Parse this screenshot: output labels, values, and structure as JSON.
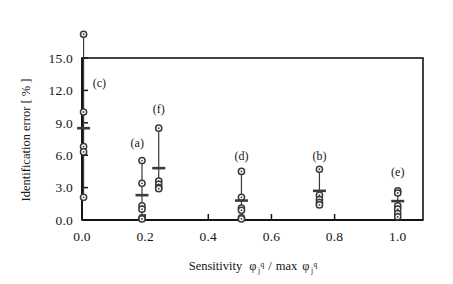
{
  "figure": {
    "name": "identification-error-vs-sensitivity-scatter"
  },
  "chart_data": {
    "type": "scatter",
    "title": "",
    "subtitle": "",
    "xlabel": "Sensitivity  φ j q / max φ j q",
    "xlabel_parts": {
      "word": "Sensitivity",
      "phi": "φ",
      "sub": "j",
      "sup": "q",
      "slash": "/",
      "max": "max"
    },
    "ylabel": "Identification error [ % ]",
    "ylabel_parts": {
      "text": "Identification error [",
      "unit": "%",
      "close": "]"
    },
    "xlim": [
      0.0,
      1.08
    ],
    "ylim": [
      0.0,
      15.0
    ],
    "xticks": [
      0.0,
      0.2,
      0.4,
      0.6,
      0.8,
      1.0
    ],
    "xtick_labels": [
      "0.0",
      "0.2",
      "0.4",
      "0.6",
      "0.8",
      "1.0"
    ],
    "yticks": [
      0.0,
      3.0,
      6.0,
      9.0,
      12.0,
      15.0
    ],
    "ytick_labels": [
      "0.0",
      "3.0",
      "6.0",
      "9.0",
      "12.0",
      "15.0"
    ],
    "grid": false,
    "legend": "none",
    "frame": "box",
    "marker": "open-circle",
    "mean_marker": "horizontal-dash",
    "range_bar": true,
    "axis_color": "#151515",
    "marker_color": "#3a3a3a",
    "series": [
      {
        "name": "(c)",
        "label": "(c)",
        "x": 0.005,
        "label_x": 0.055,
        "label_y": 12.3,
        "range_low": 2.1,
        "range_high": 17.2,
        "mean": 8.5,
        "values": [
          17.2,
          10.0,
          6.8,
          6.3,
          2.1
        ]
      },
      {
        "name": "(a)",
        "label": "(a)",
        "x": 0.19,
        "label_x": 0.175,
        "label_y": 6.8,
        "range_low": 0.1,
        "range_high": 5.5,
        "mean": 2.3,
        "values": [
          5.5,
          3.4,
          1.3,
          1.0,
          0.2,
          0.1
        ]
      },
      {
        "name": "(f)",
        "label": "(f)",
        "x": 0.243,
        "label_x": 0.243,
        "label_y": 9.9,
        "range_low": 2.8,
        "range_high": 8.5,
        "mean": 4.8,
        "values": [
          8.5,
          3.6,
          3.3,
          3.0,
          2.9
        ]
      },
      {
        "name": "(d)",
        "label": "(d)",
        "x": 0.505,
        "label_x": 0.505,
        "label_y": 5.6,
        "range_low": 0.1,
        "range_high": 4.5,
        "mean": 1.8,
        "values": [
          4.5,
          2.1,
          1.1,
          0.9,
          0.2,
          0.1
        ]
      },
      {
        "name": "(b)",
        "label": "(b)",
        "x": 0.752,
        "label_x": 0.752,
        "label_y": 5.6,
        "range_low": 1.4,
        "range_high": 4.7,
        "mean": 2.7,
        "values": [
          4.7,
          2.3,
          1.9,
          1.6,
          1.4
        ]
      },
      {
        "name": "(e)",
        "label": "(e)",
        "x": 1.0,
        "label_x": 1.0,
        "label_y": 4.1,
        "range_low": 0.3,
        "range_high": 2.7,
        "mean": 1.75,
        "values": [
          2.7,
          2.5,
          1.3,
          1.0,
          0.6,
          0.3
        ]
      }
    ]
  }
}
